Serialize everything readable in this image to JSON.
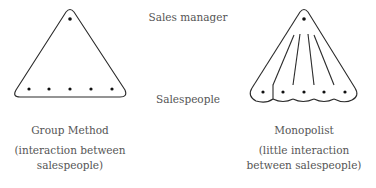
{
  "labels": {
    "top": "Sales manager",
    "middle": "Salespeople"
  },
  "diagrams": [
    {
      "name": "group-method",
      "title": "Group Method",
      "subtitle_line1": "(interaction between",
      "subtitle_line2": "salespeople)",
      "salespeople_count": 5
    },
    {
      "name": "monopolist",
      "title": "Monopolist",
      "subtitle_line1": "(little interaction",
      "subtitle_line2": "between salespeople)",
      "salespeople_count": 5
    }
  ],
  "colors": {
    "stroke": "#2a2a2a",
    "text": "#555555"
  }
}
